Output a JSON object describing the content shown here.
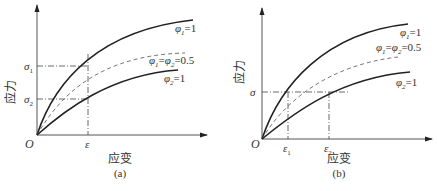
{
  "figure": {
    "panels": [
      {
        "id": "a",
        "caption": "(a)",
        "xlabel": "应变",
        "ylabel": "应力",
        "origin_label": "O",
        "x_ticks": [
          {
            "label": "ε",
            "sub": ""
          }
        ],
        "y_ticks": [
          {
            "label": "σ",
            "sub": "1"
          },
          {
            "label": "σ",
            "sub": "2"
          }
        ],
        "curves": [
          {
            "label": "φ₁=1",
            "style": "solid"
          },
          {
            "label": "φ₁=φ₂=0.5",
            "style": "dashed"
          },
          {
            "label": "φ₂=1",
            "style": "solid"
          }
        ]
      },
      {
        "id": "b",
        "caption": "(b)",
        "xlabel": "应变",
        "ylabel": "应力",
        "origin_label": "O",
        "x_ticks": [
          {
            "label": "ε",
            "sub": "1"
          },
          {
            "label": "ε",
            "sub": "2"
          }
        ],
        "y_ticks": [
          {
            "label": "σ",
            "sub": ""
          }
        ],
        "curves": [
          {
            "label": "φ₁=1",
            "style": "solid"
          },
          {
            "label": "φ₁=φ₂=0.5",
            "style": "dashed"
          },
          {
            "label": "φ₂=1",
            "style": "solid"
          }
        ]
      }
    ],
    "labels": {
      "phi": "φ",
      "sub1": "1",
      "sub2": "2",
      "eq1": "=1",
      "eq_half": "=0.5",
      "eq": "="
    }
  }
}
